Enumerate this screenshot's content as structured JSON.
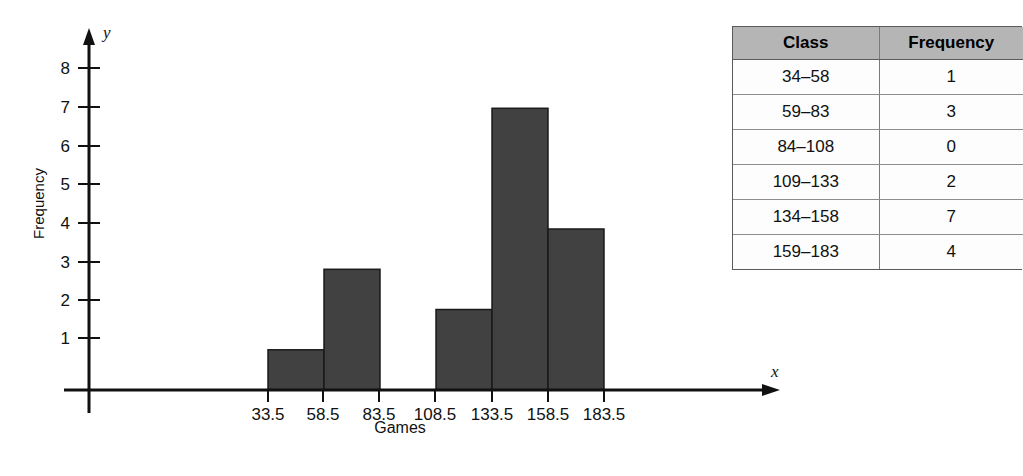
{
  "chart_data": {
    "type": "bar",
    "title": "",
    "subtitle": "",
    "xlabel": "Games",
    "ylabel": "Frequency",
    "x_axis_variable": "x",
    "y_axis_variable": "y",
    "grid": false,
    "legend": "none",
    "ylim": [
      0,
      8
    ],
    "y_ticks": [
      1,
      2,
      3,
      4,
      5,
      6,
      7,
      8
    ],
    "y_tick_labels": [
      "1",
      "2",
      "3",
      "4",
      "5",
      "6",
      "7",
      "8"
    ],
    "x_ticks": [
      33.5,
      58.5,
      83.5,
      108.5,
      133.5,
      158.5,
      183.5
    ],
    "x_tick_labels": [
      "33.5",
      "58.5",
      "83.5",
      "108.5",
      "133.5",
      "158.5",
      "183.5"
    ],
    "bar_color": "#414141",
    "bar_edge_color": "#1a1a1a",
    "categories": [
      "34-58",
      "59-83",
      "84-108",
      "109-133",
      "134-158",
      "159-183"
    ],
    "bin_edges": [
      33.5,
      58.5,
      83.5,
      108.5,
      133.5,
      158.5,
      183.5
    ],
    "values": [
      1,
      3,
      0,
      2,
      7,
      4
    ],
    "bars": [
      {
        "label": "34-58",
        "lower": 33.5,
        "upper": 58.5,
        "value": 1
      },
      {
        "label": "59-83",
        "lower": 58.5,
        "upper": 83.5,
        "value": 3
      },
      {
        "label": "84-108",
        "lower": 83.5,
        "upper": 108.5,
        "value": 0
      },
      {
        "label": "109-133",
        "lower": 108.5,
        "upper": 133.5,
        "value": 2
      },
      {
        "label": "134-158",
        "lower": 133.5,
        "upper": 158.5,
        "value": 7
      },
      {
        "label": "159-183",
        "lower": 158.5,
        "upper": 183.5,
        "value": 4
      }
    ]
  },
  "table": {
    "header": {
      "class_label": "Class",
      "frequency_label": "Frequency"
    },
    "rows": [
      {
        "class": "34–58",
        "frequency": "1"
      },
      {
        "class": "59–83",
        "frequency": "3"
      },
      {
        "class": "84–108",
        "frequency": "0"
      },
      {
        "class": "109–133",
        "frequency": "2"
      },
      {
        "class": "134–158",
        "frequency": "7"
      },
      {
        "class": "159–183",
        "frequency": "4"
      }
    ],
    "header_bg": "#b5b5b5"
  },
  "axis": {
    "y_label": "Frequency",
    "x_label": "Games",
    "y_var": "y",
    "x_var": "x",
    "y_tick_1": "1",
    "y_tick_2": "2",
    "y_tick_3": "3",
    "y_tick_4": "4",
    "y_tick_5": "5",
    "y_tick_6": "6",
    "y_tick_7": "7",
    "y_tick_8": "8",
    "x_tick_1": "33.5",
    "x_tick_2": "58.5",
    "x_tick_3": "83.5",
    "x_tick_4": "108.5",
    "x_tick_5": "133.5",
    "x_tick_6": "158.5",
    "x_tick_7": "183.5"
  }
}
